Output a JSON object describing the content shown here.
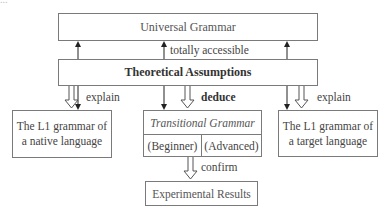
{
  "top_fragment": "...",
  "nodes": {
    "universal_grammar": "Universal Grammar",
    "theoretical_assumptions": "Theoretical Assumptions",
    "l1_native": [
      "The L1 grammar of",
      "a native language"
    ],
    "l1_target": [
      "The L1 grammar of",
      "a target language"
    ],
    "transitional_grammar": {
      "title": "Transitional Grammar",
      "stages": [
        "(Beginner)",
        "(Advanced)"
      ]
    },
    "experimental_results": "Experimental Results"
  },
  "edges": {
    "totally_accessible": "totally accessible",
    "explain_left": "explain",
    "deduce": "deduce",
    "explain_right": "explain",
    "confirm": "confirm"
  },
  "colors": {
    "line": "#222222",
    "box_border": "#7a7a7a",
    "text": "#444444"
  }
}
